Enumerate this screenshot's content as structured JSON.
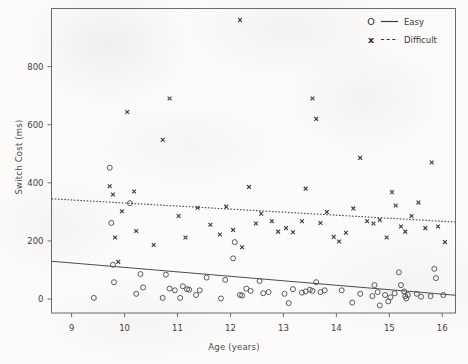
{
  "figure": {
    "background_color": "#fcfbf9",
    "axis_color": "#555555",
    "marker_color": "#3a3a3a"
  },
  "axes": {
    "xlabel": "Age (years)",
    "ylabel": "Switch Cost (ms)",
    "xticks": [
      "9",
      "10",
      "11",
      "12",
      "13",
      "14",
      "15",
      "16"
    ],
    "yticks": [
      "0",
      "200",
      "400",
      "600",
      "800"
    ]
  },
  "legend": {
    "position": "top-right",
    "entries": [
      {
        "marker": "O",
        "marker_name": "circle-marker",
        "line_style": "solid",
        "label": "Easy"
      },
      {
        "marker": "x",
        "marker_name": "x-marker",
        "line_style": "dashed",
        "label": "Difficult"
      }
    ]
  },
  "chart_data": {
    "type": "scatter",
    "title": "",
    "xlabel": "Age (years)",
    "ylabel": "Switch Cost (ms)",
    "xlim": [
      8.62,
      16.25
    ],
    "ylim": [
      -48,
      1000
    ],
    "xticks": [
      9,
      10,
      11,
      12,
      13,
      14,
      15,
      16
    ],
    "yticks": [
      0,
      200,
      400,
      600,
      800
    ],
    "grid": false,
    "legend_position": "upper right",
    "series": [
      {
        "name": "Easy",
        "marker": "o",
        "line_style": "solid",
        "fit_line": {
          "x": [
            8.62,
            16.25
          ],
          "y": [
            130,
            13
          ]
        },
        "points": [
          [
            9.72,
            452
          ],
          [
            9.75,
            262
          ],
          [
            9.78,
            118
          ],
          [
            9.8,
            58
          ],
          [
            9.42,
            4
          ],
          [
            10.1,
            330
          ],
          [
            10.22,
            18
          ],
          [
            10.3,
            86
          ],
          [
            10.35,
            40
          ],
          [
            10.72,
            4
          ],
          [
            10.78,
            84
          ],
          [
            10.85,
            36
          ],
          [
            10.95,
            30
          ],
          [
            11.05,
            4
          ],
          [
            11.1,
            44
          ],
          [
            11.18,
            34
          ],
          [
            11.22,
            32
          ],
          [
            11.35,
            14
          ],
          [
            11.42,
            30
          ],
          [
            11.55,
            74
          ],
          [
            11.82,
            2
          ],
          [
            11.9,
            66
          ],
          [
            12.05,
            140
          ],
          [
            12.08,
            196
          ],
          [
            12.18,
            14
          ],
          [
            12.22,
            12
          ],
          [
            12.3,
            36
          ],
          [
            12.38,
            28
          ],
          [
            12.55,
            62
          ],
          [
            12.62,
            20
          ],
          [
            12.72,
            24
          ],
          [
            13.02,
            18
          ],
          [
            13.1,
            -14
          ],
          [
            13.18,
            34
          ],
          [
            13.35,
            22
          ],
          [
            13.42,
            26
          ],
          [
            13.5,
            32
          ],
          [
            13.55,
            28
          ],
          [
            13.62,
            58
          ],
          [
            13.7,
            24
          ],
          [
            13.78,
            30
          ],
          [
            14.1,
            30
          ],
          [
            14.3,
            -12
          ],
          [
            14.45,
            18
          ],
          [
            14.68,
            10
          ],
          [
            14.72,
            48
          ],
          [
            14.78,
            24
          ],
          [
            14.82,
            -22
          ],
          [
            14.92,
            14
          ],
          [
            14.98,
            -8
          ],
          [
            15.02,
            6
          ],
          [
            15.1,
            20
          ],
          [
            15.18,
            92
          ],
          [
            15.22,
            48
          ],
          [
            15.28,
            26
          ],
          [
            15.3,
            10
          ],
          [
            15.32,
            2
          ],
          [
            15.35,
            14
          ],
          [
            15.52,
            18
          ],
          [
            15.6,
            8
          ],
          [
            15.78,
            10
          ],
          [
            15.85,
            104
          ],
          [
            15.88,
            72
          ],
          [
            16.02,
            14
          ]
        ]
      },
      {
        "name": "Difficult",
        "marker": "x",
        "line_style": "dashed",
        "fit_line": {
          "x": [
            8.62,
            16.25
          ],
          "y": [
            345,
            265
          ]
        },
        "points": [
          [
            9.72,
            388
          ],
          [
            9.78,
            360
          ],
          [
            9.82,
            212
          ],
          [
            9.88,
            128
          ],
          [
            9.95,
            302
          ],
          [
            10.05,
            644
          ],
          [
            10.18,
            370
          ],
          [
            10.22,
            234
          ],
          [
            10.55,
            186
          ],
          [
            10.72,
            548
          ],
          [
            10.85,
            690
          ],
          [
            11.02,
            286
          ],
          [
            11.15,
            212
          ],
          [
            11.38,
            314
          ],
          [
            11.62,
            256
          ],
          [
            11.8,
            222
          ],
          [
            11.92,
            318
          ],
          [
            12.05,
            238
          ],
          [
            12.18,
            960
          ],
          [
            12.22,
            178
          ],
          [
            12.35,
            386
          ],
          [
            12.48,
            260
          ],
          [
            12.58,
            294
          ],
          [
            12.78,
            268
          ],
          [
            12.9,
            232
          ],
          [
            13.05,
            244
          ],
          [
            13.18,
            230
          ],
          [
            13.35,
            268
          ],
          [
            13.42,
            380
          ],
          [
            13.55,
            690
          ],
          [
            13.62,
            620
          ],
          [
            13.7,
            262
          ],
          [
            13.82,
            300
          ],
          [
            13.95,
            214
          ],
          [
            14.05,
            198
          ],
          [
            14.18,
            228
          ],
          [
            14.32,
            312
          ],
          [
            14.45,
            486
          ],
          [
            14.58,
            268
          ],
          [
            14.7,
            260
          ],
          [
            14.82,
            272
          ],
          [
            14.95,
            212
          ],
          [
            15.05,
            368
          ],
          [
            15.12,
            322
          ],
          [
            15.22,
            250
          ],
          [
            15.3,
            232
          ],
          [
            15.42,
            286
          ],
          [
            15.55,
            332
          ],
          [
            15.68,
            244
          ],
          [
            15.8,
            470
          ],
          [
            15.92,
            250
          ],
          [
            16.05,
            196
          ]
        ]
      }
    ]
  }
}
